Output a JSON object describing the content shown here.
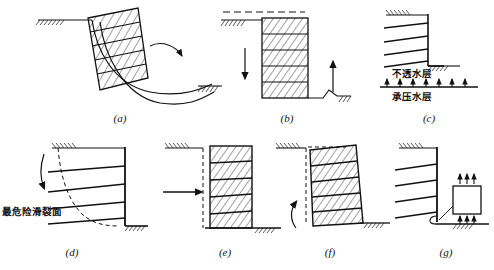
{
  "figure": {
    "type": "engineering-failure-modes-diagram",
    "background": "#ffffff",
    "stroke_color": "#111111",
    "panel_count": 7
  },
  "panels": [
    {
      "id": "a",
      "label": "(a)",
      "name": "deep-seated-circular-slip-failure",
      "wall_style": "hatched",
      "wall_bands": 5,
      "features": [
        "curved-slip-surface",
        "ground-line-left",
        "ground-line-right",
        "curved-arrow"
      ]
    },
    {
      "id": "b",
      "label": "(b)",
      "name": "basal-heave-failure",
      "wall_style": "hatched",
      "wall_bands": 5,
      "features": [
        "down-arrow",
        "up-arrow",
        "heaved-ground",
        "ground-line-left"
      ]
    },
    {
      "id": "c",
      "label": "(c)",
      "name": "confined-aquifer-uplift-failure",
      "wall_style": "outline",
      "strut_count": 4,
      "features": [
        "uplift-pressure-arrows",
        "aquifer-line"
      ],
      "annotations": [
        {
          "text": "不透水层",
          "name": "impermeable-layer-label"
        },
        {
          "text": "承压水层",
          "name": "confined-aquifer-label"
        }
      ]
    },
    {
      "id": "d",
      "label": "(d)",
      "name": "overall-slope-slip-failure",
      "wall_style": "outline",
      "strut_count": 4,
      "features": [
        "dashed-slip-surface",
        "curved-arrow"
      ],
      "annotations": [
        {
          "text": "最危险滑裂面",
          "name": "most-dangerous-slip-surface-label"
        }
      ]
    },
    {
      "id": "e",
      "label": "(e)",
      "name": "lateral-translation-failure",
      "wall_style": "hatched",
      "wall_bands": 5,
      "features": [
        "dashed-original-position",
        "horizontal-arrow"
      ]
    },
    {
      "id": "f",
      "label": "(f)",
      "name": "rotational-tilting-failure",
      "wall_style": "hatched",
      "wall_bands": 5,
      "features": [
        "dashed-original-position",
        "curved-arrow"
      ]
    },
    {
      "id": "g",
      "label": "(g)",
      "name": "toe-bearing-capacity-failure",
      "wall_style": "outline",
      "strut_count": 4,
      "features": [
        "soil-element-box",
        "upward-pressure-arrows-top",
        "upward-pressure-arrows-bottom",
        "leader-line"
      ]
    }
  ],
  "labels": {
    "a": "(a)",
    "b": "(b)",
    "c": "(c)",
    "d": "(d)",
    "e": "(e)",
    "f": "(f)",
    "g": "(g)"
  },
  "text": {
    "impermeable_layer": "不透水层",
    "confined_aquifer": "承压水层",
    "slip_surface": "最危险滑裂面"
  }
}
